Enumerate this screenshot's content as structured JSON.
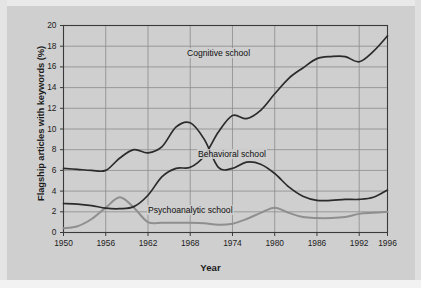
{
  "chart_data": {
    "type": "line",
    "title": "",
    "xlabel": "Year",
    "ylabel": "Flagship articles with keywords (%)",
    "xlim": [
      1950,
      1996
    ],
    "ylim": [
      0,
      20
    ],
    "ytick_step": 2,
    "yticks": [
      "0",
      "2",
      "4",
      "6",
      "8",
      "10",
      "12",
      "14",
      "16",
      "18",
      "20"
    ],
    "xticks": [
      "1950",
      "1956",
      "1962",
      "1968",
      "1974",
      "1980",
      "1986",
      "1992",
      "1996"
    ],
    "grid": true,
    "legend_position": "inline-annotations",
    "series": [
      {
        "name": "Cognitive school",
        "color": "#2b2b2b",
        "label_x": 1972,
        "label_y": 17.3,
        "x": [
          1950,
          1952,
          1954,
          1956,
          1958,
          1960,
          1962,
          1964,
          1966,
          1968,
          1970,
          1972,
          1974,
          1976,
          1978,
          1980,
          1982,
          1984,
          1986,
          1988,
          1990,
          1992,
          1994,
          1996
        ],
        "values": [
          2.8,
          2.75,
          2.6,
          2.35,
          2.3,
          2.5,
          3.6,
          5.4,
          6.2,
          6.3,
          7.4,
          9.7,
          11.3,
          11.0,
          11.8,
          13.4,
          14.9,
          15.9,
          16.8,
          17.0,
          17.0,
          16.5,
          17.5,
          19.0
        ]
      },
      {
        "name": "Behavioral school",
        "color": "#2b2b2b",
        "label_x": 1974,
        "label_y": 7.6,
        "x": [
          1950,
          1952,
          1954,
          1956,
          1958,
          1960,
          1962,
          1964,
          1966,
          1968,
          1970,
          1972,
          1974,
          1976,
          1978,
          1980,
          1982,
          1984,
          1986,
          1988,
          1990,
          1992,
          1994,
          1996
        ],
        "values": [
          6.2,
          6.1,
          6.0,
          6.0,
          7.2,
          8.0,
          7.7,
          8.3,
          10.2,
          10.6,
          9.0,
          6.3,
          6.2,
          6.8,
          6.6,
          5.7,
          4.4,
          3.5,
          3.1,
          3.1,
          3.2,
          3.2,
          3.4,
          4.1
        ]
      },
      {
        "name": "Psychoanalytic school",
        "color": "#8f8f8f",
        "label_x": 1968,
        "label_y": 2.15,
        "x": [
          1950,
          1952,
          1954,
          1956,
          1958,
          1960,
          1962,
          1964,
          1966,
          1968,
          1970,
          1972,
          1974,
          1976,
          1978,
          1980,
          1982,
          1984,
          1986,
          1988,
          1990,
          1992,
          1994,
          1996
        ],
        "values": [
          0.4,
          0.6,
          1.3,
          2.4,
          3.4,
          2.4,
          1.0,
          0.95,
          0.95,
          0.95,
          0.9,
          0.75,
          0.85,
          1.3,
          1.9,
          2.4,
          1.9,
          1.5,
          1.4,
          1.4,
          1.5,
          1.8,
          1.9,
          2.0
        ]
      }
    ]
  },
  "axes": {
    "ylabel": "Flagship articles with keywords (%)",
    "xlabel": "Year"
  },
  "annotations": {
    "cognitive": "Cognitive school",
    "behavioral": "Behavioral school",
    "psychoanalytic": "Psychoanalytic school"
  },
  "colors": {
    "background": "#cfcfcf",
    "grid": "#8b8b8b",
    "axis": "#3a3a3a",
    "dark_series": "#2b2b2b",
    "gray_series": "#8f8f8f"
  }
}
